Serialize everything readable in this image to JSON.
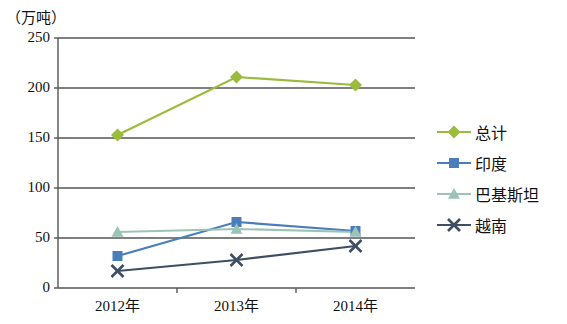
{
  "unit_label": "（万吨）",
  "legend": [
    {
      "label": "总计",
      "color": "#9bbb3c",
      "marker": "diamond"
    },
    {
      "label": "印度",
      "color": "#4a7ebb",
      "marker": "square"
    },
    {
      "label": "巴基斯坦",
      "color": "#9cc3b8",
      "marker": "triangle"
    },
    {
      "label": "越南",
      "color": "#3f4e63",
      "marker": "x"
    }
  ],
  "axis": {
    "y_ticks": [
      "0",
      "50",
      "100",
      "150",
      "200",
      "250"
    ],
    "x_ticks": [
      "2012年",
      "2013年",
      "2014年"
    ]
  },
  "chart_data": {
    "type": "line",
    "title": "",
    "subtitle": "",
    "xlabel": "",
    "ylabel": "（万吨）",
    "categories": [
      "2012年",
      "2013年",
      "2014年"
    ],
    "ylim": [
      0,
      250
    ],
    "ytick_values": [
      0,
      50,
      100,
      150,
      200,
      250
    ],
    "grid": true,
    "legend_position": "right",
    "series": [
      {
        "name": "总计",
        "color": "#9bbb3c",
        "marker": "diamond",
        "values": [
          153,
          211,
          203
        ]
      },
      {
        "name": "印度",
        "color": "#4a7ebb",
        "marker": "square",
        "values": [
          32,
          66,
          57
        ]
      },
      {
        "name": "巴基斯坦",
        "color": "#9cc3b8",
        "marker": "triangle",
        "values": [
          56,
          59,
          56
        ]
      },
      {
        "name": "越南",
        "color": "#3f4e63",
        "marker": "x",
        "values": [
          17,
          28,
          42
        ]
      }
    ]
  }
}
